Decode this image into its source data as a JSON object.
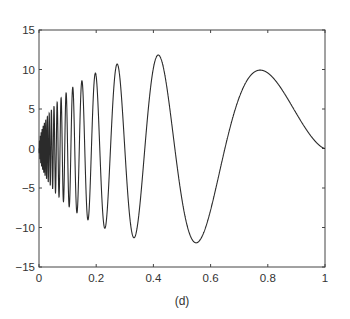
{
  "chart_data": {
    "type": "line",
    "title": "",
    "caption": "(d)",
    "xlabel": "",
    "ylabel": "",
    "xlim": [
      0,
      1
    ],
    "ylim": [
      -15,
      15
    ],
    "grid": false,
    "legend": null,
    "xticks": [
      0,
      0.2,
      0.4,
      0.6,
      0.8,
      1
    ],
    "xtick_labels": [
      "0",
      "0.2",
      "0.4",
      "0.6",
      "0.8",
      "1"
    ],
    "yticks": [
      -15,
      -10,
      -5,
      0,
      5,
      10,
      15
    ],
    "ytick_labels": [
      "−15",
      "−10",
      "−5",
      "0",
      "5",
      "10",
      "15"
    ],
    "series": [
      {
        "name": "Doppler signal",
        "description": "f(x) = A * sqrt(x(1-x)) * sin(2.1*pi/(x+0.05)), A ~ 24",
        "amplitude": 24,
        "epsilon": 0.05,
        "freq": 2.1,
        "color": "#2b2b2b",
        "extrema": [
          {
            "x": 0.17,
            "y": -9.1
          },
          {
            "x": 0.2,
            "y": 9.5
          },
          {
            "x": 0.23,
            "y": -10.1
          },
          {
            "x": 0.27,
            "y": 10.6
          },
          {
            "x": 0.33,
            "y": -11.3
          },
          {
            "x": 0.42,
            "y": 11.8
          },
          {
            "x": 0.55,
            "y": -12.0
          },
          {
            "x": 0.77,
            "y": 10.0
          },
          {
            "x": 1.0,
            "y": 0.0
          }
        ]
      }
    ]
  }
}
